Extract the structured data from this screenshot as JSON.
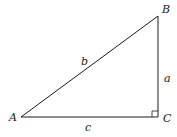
{
  "diagram": {
    "type": "right-triangle",
    "colors": {
      "stroke": "#1a1a1a",
      "background": "#ffffff"
    },
    "vertices": {
      "A": {
        "label": "A",
        "x": 21,
        "y": 117
      },
      "B": {
        "label": "B",
        "x": 158,
        "y": 16
      },
      "C": {
        "label": "C",
        "x": 158,
        "y": 117
      }
    },
    "sides": {
      "a": {
        "label": "a",
        "from": "B",
        "to": "C"
      },
      "b": {
        "label": "b",
        "from": "A",
        "to": "B"
      },
      "c": {
        "label": "c",
        "from": "A",
        "to": "C"
      }
    },
    "right_angle_at": "C"
  }
}
